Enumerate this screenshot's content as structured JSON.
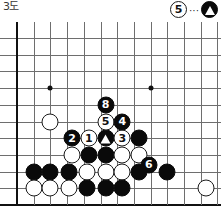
{
  "figure": {
    "label": "3도",
    "caption": {
      "white_move": "5",
      "dots": "···",
      "black_marker": "triangle-stone",
      "meaning": "⑤ = ▲"
    }
  },
  "board": {
    "cols": 13,
    "rows": 11,
    "spacing": 16.7,
    "origin_x": 17,
    "origin_y": 16,
    "edges": [
      "left",
      "bottom"
    ],
    "star_points": [
      {
        "col": 2,
        "row": 3
      },
      {
        "col": 8,
        "row": 3
      }
    ],
    "colors": {
      "line": "#6e6e6e",
      "edge": "#111111",
      "black_stone": "#0a0a0a",
      "white_stone": "#ffffff",
      "background": "#ffffff"
    }
  },
  "stones": [
    {
      "id": "w-a",
      "color": "white",
      "col": 2,
      "row": 5,
      "label": ""
    },
    {
      "id": "b-2",
      "color": "black",
      "col": 3.3,
      "row": 6,
      "label": "2"
    },
    {
      "id": "w-1",
      "color": "white",
      "col": 4.3,
      "row": 6,
      "label": "1"
    },
    {
      "id": "b-tri",
      "color": "black",
      "col": 5.3,
      "row": 6,
      "label": "",
      "marker": "triangle"
    },
    {
      "id": "w-3",
      "color": "white",
      "col": 6.3,
      "row": 6,
      "label": "3"
    },
    {
      "id": "b-r1",
      "color": "black",
      "col": 7.3,
      "row": 6,
      "label": ""
    },
    {
      "id": "w-5",
      "color": "white",
      "col": 5.3,
      "row": 5,
      "label": "5"
    },
    {
      "id": "b-4",
      "color": "black",
      "col": 6.3,
      "row": 5,
      "label": "4"
    },
    {
      "id": "b-8",
      "color": "black",
      "col": 5.3,
      "row": 4,
      "label": "8"
    },
    {
      "id": "w-b",
      "color": "white",
      "col": 3.3,
      "row": 7,
      "label": ""
    },
    {
      "id": "b-c",
      "color": "black",
      "col": 4.3,
      "row": 7,
      "label": ""
    },
    {
      "id": "b-d",
      "color": "black",
      "col": 5.3,
      "row": 7,
      "label": ""
    },
    {
      "id": "w-e",
      "color": "white",
      "col": 6.3,
      "row": 7,
      "label": ""
    },
    {
      "id": "w-f",
      "color": "white",
      "col": 7.3,
      "row": 7,
      "label": ""
    },
    {
      "id": "b-6",
      "color": "black",
      "col": 7.9,
      "row": 7.6,
      "label": "6"
    },
    {
      "id": "b-g",
      "color": "black",
      "col": 1,
      "row": 8,
      "label": ""
    },
    {
      "id": "b-h",
      "color": "black",
      "col": 2,
      "row": 8,
      "label": ""
    },
    {
      "id": "b-i",
      "color": "black",
      "col": 3.1,
      "row": 8,
      "label": ""
    },
    {
      "id": "w-j",
      "color": "white",
      "col": 4.2,
      "row": 8,
      "label": ""
    },
    {
      "id": "w-k",
      "color": "white",
      "col": 5.3,
      "row": 8,
      "label": ""
    },
    {
      "id": "w-l",
      "color": "white",
      "col": 6.3,
      "row": 8,
      "label": ""
    },
    {
      "id": "b-m",
      "color": "black",
      "col": 7.3,
      "row": 8,
      "label": ""
    },
    {
      "id": "b-n",
      "color": "black",
      "col": 9,
      "row": 8,
      "label": ""
    },
    {
      "id": "w-o",
      "color": "white",
      "col": 1,
      "row": 9,
      "label": ""
    },
    {
      "id": "w-p",
      "color": "white",
      "col": 2,
      "row": 9,
      "label": ""
    },
    {
      "id": "w-q",
      "color": "white",
      "col": 3.1,
      "row": 9,
      "label": ""
    },
    {
      "id": "b-r",
      "color": "black",
      "col": 4.2,
      "row": 9,
      "label": ""
    },
    {
      "id": "b-s",
      "color": "black",
      "col": 5.3,
      "row": 9,
      "label": ""
    },
    {
      "id": "b-t",
      "color": "black",
      "col": 6.3,
      "row": 9,
      "label": ""
    },
    {
      "id": "w-u",
      "color": "white",
      "col": 11.3,
      "row": 9,
      "label": ""
    }
  ]
}
